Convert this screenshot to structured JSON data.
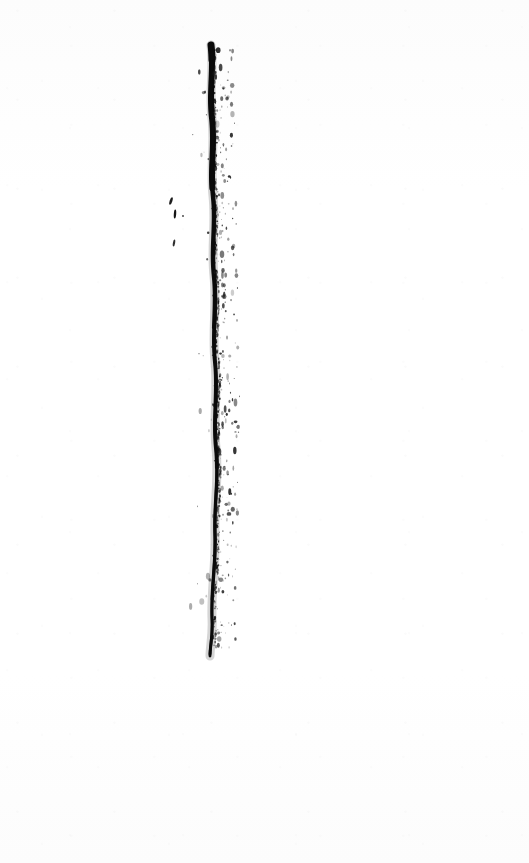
{
  "document": {
    "title": "Ink Line Scan",
    "medium": "black ink on white paper",
    "orientation": "portrait",
    "width_px": 529,
    "height_px": 863
  },
  "colors": {
    "background": "#fdfdfd",
    "paper_shade": "#fcfcfc",
    "ink": "#0a0a0a",
    "ink_soft": "#2b2b2b",
    "speckle": "#1a1a1a"
  },
  "artwork": {
    "name": "vertical-ink-stroke",
    "description": "A single rough, near-vertical hand-drawn ink stroke running from the upper area to the lower-middle of the page, with dry-brush speckle scatter along its right edge and a few small detached ink marks to its left.",
    "stroke": {
      "top_x": 211,
      "top_y": 45,
      "bottom_x": 210,
      "bottom_y": 656,
      "length_px": 611,
      "max_width_px": 7,
      "min_width_px": 2,
      "center_x_mean": 213,
      "path": "M 211 45 C 214 70, 209 92, 212 118 C 215 146, 210 168, 213 196 C 216 224, 211 248, 214 276 C 217 306, 212 332, 215 362 C 218 392, 213 418, 216 448 C 219 478, 214 504, 215 534 C 216 564, 211 590, 212 618 C 213 636, 210 646, 210 656"
    },
    "segments": [
      {
        "name": "top-blot",
        "y_start": 45,
        "y_end": 62,
        "width": 7,
        "opacity": 1
      },
      {
        "name": "upper-thick",
        "y_start": 62,
        "y_end": 190,
        "width": 6,
        "opacity": 1
      },
      {
        "name": "mid-upper",
        "y_start": 190,
        "y_end": 330,
        "width": 4.5,
        "opacity": 0.97
      },
      {
        "name": "mid",
        "y_start": 330,
        "y_end": 470,
        "width": 4,
        "opacity": 0.95
      },
      {
        "name": "lower",
        "y_start": 470,
        "y_end": 600,
        "width": 3.4,
        "opacity": 0.94
      },
      {
        "name": "tail",
        "y_start": 600,
        "y_end": 656,
        "width": 3,
        "opacity": 0.9
      }
    ],
    "detached_marks": [
      {
        "name": "comma-mark",
        "x": 171,
        "y": 201,
        "w": 2.6,
        "h": 8,
        "rotate": 18,
        "opacity": 0.92
      },
      {
        "name": "tick-mark",
        "x": 175,
        "y": 214,
        "w": 2.4,
        "h": 9,
        "rotate": 4,
        "opacity": 0.95
      },
      {
        "name": "dot-mark",
        "x": 183,
        "y": 216,
        "w": 1.8,
        "h": 2.2,
        "rotate": 0,
        "opacity": 0.8
      },
      {
        "name": "lower-tick-mark",
        "x": 174,
        "y": 243,
        "w": 2.2,
        "h": 7,
        "rotate": 10,
        "opacity": 0.85
      }
    ],
    "speckle_field": {
      "description": "fine dry-brush ink specks scattered mainly 2-22px to the right of the stroke core",
      "x_offset_min": 2,
      "x_offset_max": 24,
      "y_start": 50,
      "y_end": 650,
      "count": 340,
      "size_min_px": 0.5,
      "size_max_px": 2.4
    }
  }
}
